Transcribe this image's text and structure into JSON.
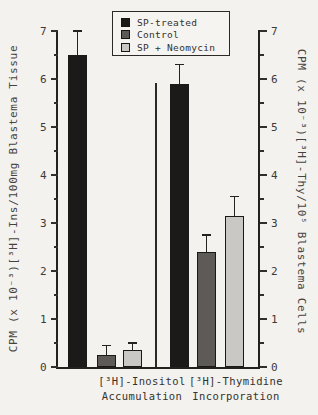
{
  "figure": {
    "background": "#f4f2ee",
    "ink": "#232221"
  },
  "legend": {
    "items": [
      {
        "label": "SP-treated",
        "swatch": "#1b1a19",
        "icon": "filled-square-swatch"
      },
      {
        "label": "Control",
        "swatch": "#5d5a58",
        "icon": "filled-square-swatch"
      },
      {
        "label": "SP + Neomycin",
        "swatch": "#c9c8c4",
        "icon": "filled-square-swatch"
      }
    ]
  },
  "chart_data": {
    "type": "bar",
    "title": "",
    "categories": [
      "[³H]-Inositol Accumulation",
      "[³H]-Thymidine Incorporation"
    ],
    "category_label_lines": [
      [
        "[³H]-Inositol",
        "Accumulation"
      ],
      [
        "[³H]-Thymidine",
        "Incorporation"
      ]
    ],
    "series": [
      {
        "name": "SP-treated",
        "color": "#1b1a19",
        "values": [
          6.5,
          5.9
        ],
        "errors_plus": [
          0.5,
          0.4
        ]
      },
      {
        "name": "Control",
        "color": "#5d5a58",
        "values": [
          0.25,
          2.4
        ],
        "errors_plus": [
          0.2,
          0.35
        ]
      },
      {
        "name": "SP + Neomycin",
        "color": "#c9c8c4",
        "values": [
          0.35,
          3.15
        ],
        "errors_plus": [
          0.15,
          0.4
        ]
      }
    ],
    "left_axis_label": "CPM (x 10⁻³)[³H]-Ins/100mg Blastema Tissue",
    "right_axis_label": "CPM (x 10⁻³)[³H]-Thy/10⁵ Blastema Cells",
    "xlabel": "",
    "ylabel_left": "CPM (x 10⁻³)[³H]-Ins/100mg Blastema Tissue",
    "ylabel_right": "CPM (x 10⁻³)[³H]-Thy/10⁵ Blastema Cells",
    "ylim": [
      0,
      7
    ],
    "ytick_step": 1,
    "ytick_minor_step": 0.5,
    "ytick_labels": [
      "0",
      "1",
      "2",
      "3",
      "4",
      "5",
      "6",
      "7"
    ],
    "grid": false,
    "error_bars": "upper-only",
    "legend_position": "top-center"
  }
}
